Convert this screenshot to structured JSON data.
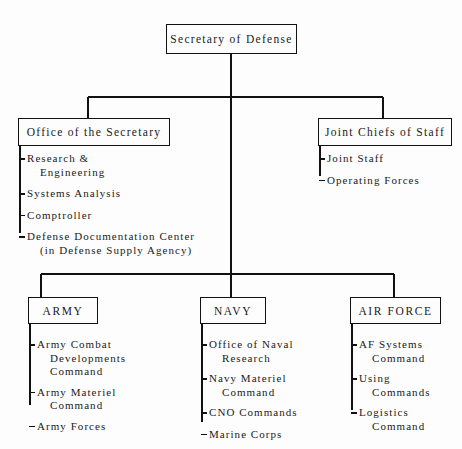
{
  "document": {
    "type": "organization-chart",
    "subject": "Department of Defense organization"
  },
  "nodes": {
    "root": {
      "label": "Secretary of Defense"
    },
    "office_of_secretary": {
      "label": "Office of the Secretary"
    },
    "joint_chiefs": {
      "label": "Joint Chiefs of Staff"
    },
    "army": {
      "label": "ARMY"
    },
    "navy": {
      "label": "NAVY"
    },
    "air_force": {
      "label": "AIR FORCE"
    }
  },
  "sub_items": {
    "office_of_secretary": [
      {
        "line1": "Research &",
        "line2": "Engineering"
      },
      {
        "line1": "Systems Analysis",
        "line2": ""
      },
      {
        "line1": "Comptroller",
        "line2": ""
      },
      {
        "line1": "Defense Documentation Center",
        "line2": "(in Defense Supply Agency)"
      }
    ],
    "joint_chiefs": [
      {
        "line1": "Joint Staff",
        "line2": ""
      },
      {
        "line1": "Operating Forces",
        "line2": ""
      }
    ],
    "army": [
      {
        "line1": "Army Combat",
        "line2": "Developments",
        "line3": "Command"
      },
      {
        "line1": "Army Materiel",
        "line2": "Command"
      },
      {
        "line1": "Army Forces",
        "line2": ""
      }
    ],
    "navy": [
      {
        "line1": "Office of Naval",
        "line2": "Research"
      },
      {
        "line1": "Navy Materiel",
        "line2": "Command"
      },
      {
        "line1": "CNO Commands",
        "line2": ""
      },
      {
        "line1": "Marine Corps",
        "line2": ""
      }
    ],
    "air_force": [
      {
        "line1": "AF Systems",
        "line2": "Command"
      },
      {
        "line1": "Using",
        "line2": "Commands"
      },
      {
        "line1": "Logistics",
        "line2": "Command"
      }
    ]
  },
  "colors": {
    "ink": "#111111",
    "paper": "#fdfdfd"
  }
}
